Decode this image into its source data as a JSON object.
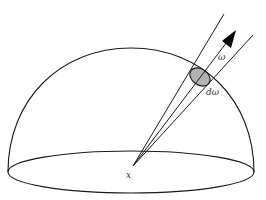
{
  "diagram": {
    "type": "hemisphere-solid-angle",
    "labels": {
      "origin": "x",
      "direction": "ω",
      "solid_angle": "dω"
    },
    "colors": {
      "stroke": "#1a1a1a",
      "patch_fill": "#b3b3b3",
      "background": "#ffffff"
    }
  }
}
